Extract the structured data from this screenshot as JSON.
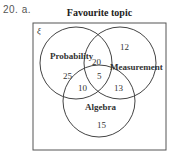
{
  "question": {
    "number": "20. a."
  },
  "diagram": {
    "title": "Favourite topic",
    "universal_symbol": "ξ",
    "sets": [
      {
        "name": "Probability"
      },
      {
        "name": "Measurement"
      },
      {
        "name": "Algebra"
      }
    ],
    "regions": {
      "probability_only": "25",
      "measurement_only": "12",
      "algebra_only": "15",
      "probability_measurement": "20",
      "probability_algebra": "10",
      "measurement_algebra": "13",
      "all_three": "5"
    },
    "colors": {
      "stroke": "#444444",
      "text": "#333333"
    }
  }
}
